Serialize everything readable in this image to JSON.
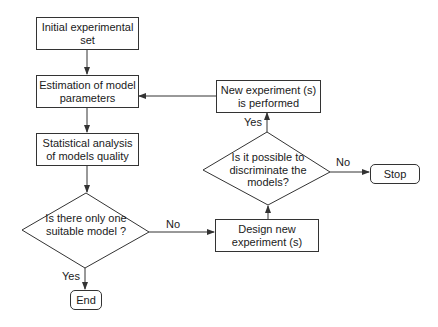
{
  "nodes": {
    "initial_set": "Initial experimental set",
    "estimation": "Estimation of model parameters",
    "statistical": "Statistical analysis of models quality",
    "one_model": "Is there only one suitable model ?",
    "end": "End",
    "design": "Design new experiment (s)",
    "discriminate": "Is it possible to discriminate the models?",
    "performed": "New experiment (s) is performed",
    "stop": "Stop"
  },
  "labels": {
    "one_model_no": "No",
    "one_model_yes": "Yes",
    "discriminate_yes": "Yes",
    "discriminate_no": "No"
  },
  "colors": {
    "line": "#333333",
    "text": "#1a1a1a",
    "background": "#ffffff"
  }
}
